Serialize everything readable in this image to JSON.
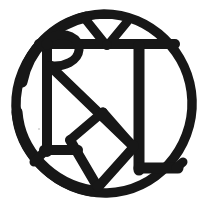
{
  "artwork": {
    "title": "Hand-drawn circular monogram",
    "type": "monogram-mark",
    "medium": "black ink on white paper",
    "letters": "RTKV",
    "description": "Interlocking letterforms R, T, K and V enclosed in a hand-inked circle",
    "alt_text": "Black hand-drawn monogram of interlocking letters inside a circle"
  },
  "canvas": {
    "width": 210,
    "height": 209,
    "background_color": "#ffffff"
  },
  "palette": {
    "ink": "#171717",
    "ink_soft": "#1e1e1e",
    "paper": "#ffffff",
    "speck": "#cfcfcf"
  },
  "geometry": {
    "circle": {
      "center_x": 104,
      "center_y": 103,
      "radius_x": 88,
      "radius_y": 89,
      "stroke_width": 9
    },
    "strokes": {
      "main_width": 9,
      "thin_width": 8,
      "heavy_width": 11
    }
  },
  "elements": [
    {
      "name": "outer-circle",
      "label": "Enclosing circle"
    },
    {
      "name": "letter-r",
      "label": "Letter R"
    },
    {
      "name": "letter-t",
      "label": "Letter T"
    },
    {
      "name": "letter-k",
      "label": "Letter K"
    },
    {
      "name": "letter-v",
      "label": "Letter V"
    },
    {
      "name": "top-notch",
      "label": "Top triangular notch"
    }
  ]
}
